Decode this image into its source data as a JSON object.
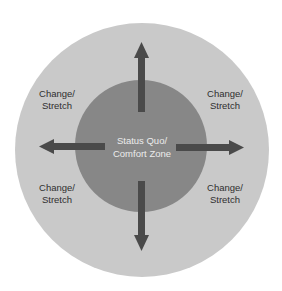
{
  "diagram": {
    "colors": {
      "background": "#ffffff",
      "outer_circle": "#c9c9c9",
      "inner_circle": "#878787",
      "arrow": "#4a4a4a",
      "label_text": "#2f2f2f",
      "center_text": "#ececec"
    },
    "center_label": {
      "line1": "Status Quo/",
      "line2": "Comfort Zone"
    },
    "zone_labels": [
      {
        "position": "top-left",
        "line1": "Change/",
        "line2": "Stretch"
      },
      {
        "position": "top-right",
        "line1": "Change/",
        "line2": "Stretch"
      },
      {
        "position": "bottom-left",
        "line1": "Change/",
        "line2": "Stretch"
      },
      {
        "position": "bottom-right",
        "line1": "Change/",
        "line2": "Stretch"
      }
    ],
    "arrows": [
      "up",
      "down",
      "left",
      "right"
    ]
  }
}
